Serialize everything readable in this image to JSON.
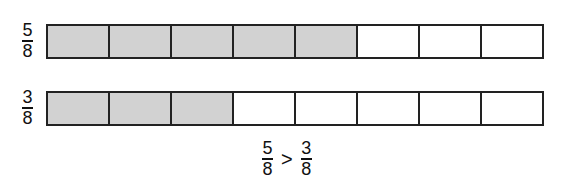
{
  "rows": [
    {
      "label": {
        "numerator": "5",
        "denominator": "8"
      },
      "total": 8,
      "shaded": 5
    },
    {
      "label": {
        "numerator": "3",
        "denominator": "8"
      },
      "total": 8,
      "shaded": 3
    }
  ],
  "comparison": {
    "left": {
      "numerator": "5",
      "denominator": "8"
    },
    "operator": ">",
    "right": {
      "numerator": "3",
      "denominator": "8"
    }
  },
  "colors": {
    "shaded": "#d2d2d2",
    "border": "#222222"
  }
}
